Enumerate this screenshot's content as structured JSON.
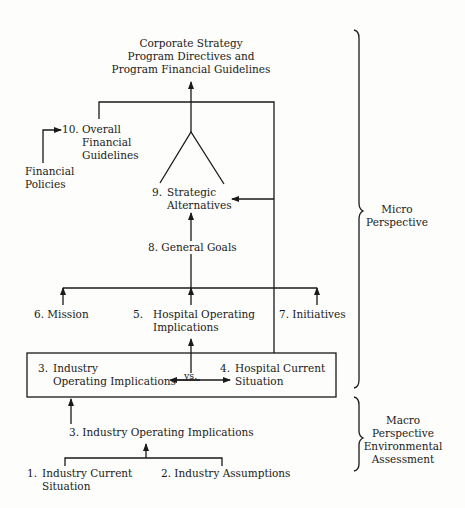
{
  "diagram": {
    "top_output": {
      "line1": "Corporate Strategy",
      "line2": "Program Directives and",
      "line3": "Program Financial Guidelines"
    },
    "nodes": {
      "n10": {
        "num": "10.",
        "line1": "Overall",
        "line2": "Financial",
        "line3": "Guidelines"
      },
      "financial_policies": {
        "line1": "Financial",
        "line2": "Policies"
      },
      "n9": {
        "num": "9.",
        "line1": "Strategic",
        "line2": "Alternatives"
      },
      "n8": {
        "label": "8.  General Goals"
      },
      "n6": {
        "label": "6.  Mission"
      },
      "n5": {
        "num": "5.",
        "line1": "Hospital Operating",
        "line2": "Implications"
      },
      "n7": {
        "label": "7.  Initiatives"
      },
      "n3_box": {
        "num": "3.",
        "line1": "Industry",
        "line2": "Operating Implications"
      },
      "vs": "vs.",
      "n4": {
        "num": "4.",
        "line1": "Hospital Current",
        "line2": "Situation"
      },
      "n3": {
        "label": "3.  Industry Operating Implications"
      },
      "n1": {
        "num": "1.",
        "line1": "Industry Current",
        "line2": "Situation"
      },
      "n2": {
        "label": "2.  Industry Assumptions"
      }
    },
    "perspectives": {
      "micro": {
        "line1": "Micro",
        "line2": "Perspective"
      },
      "macro": {
        "line1": "Macro",
        "line2": "Perspective",
        "line3": "Environmental",
        "line4": "Assessment"
      }
    },
    "colors": {
      "ink": "#1a1a1a",
      "paper": "#fdfdfb"
    }
  }
}
